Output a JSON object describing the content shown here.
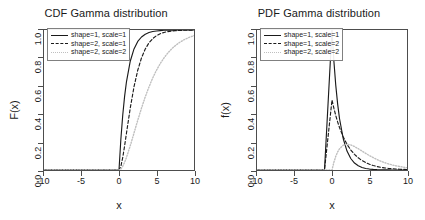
{
  "figure": {
    "background": "#ffffff",
    "panel_count": 2
  },
  "chart_data": [
    {
      "type": "line",
      "title": "CDF Gamma distribution",
      "xlabel": "x",
      "ylabel": "F(x)",
      "xlim": [
        -10,
        10
      ],
      "ylim": [
        0.0,
        1.0
      ],
      "xticks": [
        "-10",
        "-5",
        "0",
        "5",
        "10"
      ],
      "yticks": [
        "0.0",
        "0.2",
        "0.4",
        "0.6",
        "0.8",
        "1.0"
      ],
      "grid": false,
      "legend_position": "top-left",
      "x": [
        -10,
        -8,
        -6,
        -4,
        -2,
        -1,
        0,
        0.25,
        0.5,
        0.75,
        1,
        1.5,
        2,
        2.5,
        3,
        3.5,
        4,
        4.5,
        5,
        5.5,
        6,
        6.5,
        7,
        7.5,
        8,
        8.5,
        9,
        9.5,
        10
      ],
      "series": [
        {
          "name": "shape=1, scale=1",
          "style": "solid",
          "color": "#1a1a1a",
          "values": [
            0,
            0,
            0,
            0,
            0,
            0,
            0,
            0.221,
            0.393,
            0.528,
            0.632,
            0.777,
            0.865,
            0.918,
            0.95,
            0.97,
            0.982,
            0.989,
            0.993,
            0.996,
            0.998,
            0.998,
            0.999,
            0.999,
            1.0,
            1.0,
            1.0,
            1.0,
            1.0
          ]
        },
        {
          "name": "shape=2, scale=1",
          "style": "dashed",
          "color": "#1a1a1a",
          "values": [
            0,
            0,
            0,
            0,
            0,
            0,
            0,
            0.0265,
            0.0902,
            0.1734,
            0.2642,
            0.4422,
            0.594,
            0.7127,
            0.8009,
            0.8641,
            0.9084,
            0.9389,
            0.9596,
            0.9735,
            0.9826,
            0.9887,
            0.9927,
            0.9953,
            0.997,
            0.9981,
            0.9988,
            0.9992,
            0.9995
          ]
        },
        {
          "name": "shape=2, scale=2",
          "style": "dotted",
          "color": "#bfbfbf",
          "values": [
            0,
            0,
            0,
            0,
            0,
            0,
            0,
            0.0073,
            0.0265,
            0.0555,
            0.0902,
            0.1734,
            0.2642,
            0.3554,
            0.4422,
            0.5221,
            0.594,
            0.6575,
            0.7127,
            0.7603,
            0.8009,
            0.8352,
            0.8641,
            0.8882,
            0.9084,
            0.9251,
            0.9389,
            0.9503,
            0.9596
          ]
        }
      ]
    },
    {
      "type": "line",
      "title": "PDF Gamma distribution",
      "xlabel": "x",
      "ylabel": "f(x)",
      "xlim": [
        -10,
        10
      ],
      "ylim": [
        0.0,
        1.0
      ],
      "xticks": [
        "-10",
        "-5",
        "0",
        "5",
        "10"
      ],
      "yticks": [
        "0.0",
        "0.2",
        "0.4",
        "0.6",
        "0.8",
        "1.0"
      ],
      "grid": false,
      "legend_position": "top-left",
      "x": [
        -10,
        -8,
        -6,
        -4,
        -2,
        -1,
        0,
        0.25,
        0.5,
        0.75,
        1,
        1.5,
        2,
        2.5,
        3,
        3.5,
        4,
        4.5,
        5,
        5.5,
        6,
        6.5,
        7,
        7.5,
        8,
        8.5,
        9,
        9.5,
        10
      ],
      "series": [
        {
          "name": "shape=1, scale=1",
          "style": "solid",
          "color": "#1a1a1a",
          "values": [
            0,
            0,
            0,
            0,
            0,
            0,
            1.0,
            0.7788,
            0.6065,
            0.4724,
            0.3679,
            0.2231,
            0.1353,
            0.0821,
            0.0498,
            0.0302,
            0.0183,
            0.0111,
            0.0067,
            0.0041,
            0.0025,
            0.0015,
            0.0009,
            0.0006,
            0.0003,
            0.0002,
            0.0001,
            0.0001,
            0.0
          ]
        },
        {
          "name": "shape=1, scale=2",
          "style": "dashed",
          "color": "#1a1a1a",
          "values": [
            0,
            0,
            0,
            0,
            0,
            0,
            0.5,
            0.4412,
            0.3894,
            0.3436,
            0.3033,
            0.2362,
            0.1839,
            0.1433,
            0.1116,
            0.0869,
            0.0677,
            0.0527,
            0.041,
            0.032,
            0.0249,
            0.0194,
            0.0151,
            0.0117,
            0.0092,
            0.0071,
            0.0056,
            0.0043,
            0.0034
          ]
        },
        {
          "name": "shape=2, scale=2",
          "style": "dotted",
          "color": "#bfbfbf",
          "values": [
            0,
            0,
            0,
            0,
            0,
            0,
            0.0,
            0.0551,
            0.0974,
            0.1288,
            0.1516,
            0.1772,
            0.1839,
            0.1791,
            0.1674,
            0.1521,
            0.1353,
            0.1186,
            0.1026,
            0.0879,
            0.0747,
            0.063,
            0.0528,
            0.044,
            0.0366,
            0.0303,
            0.025,
            0.0205,
            0.0168
          ]
        }
      ]
    }
  ]
}
